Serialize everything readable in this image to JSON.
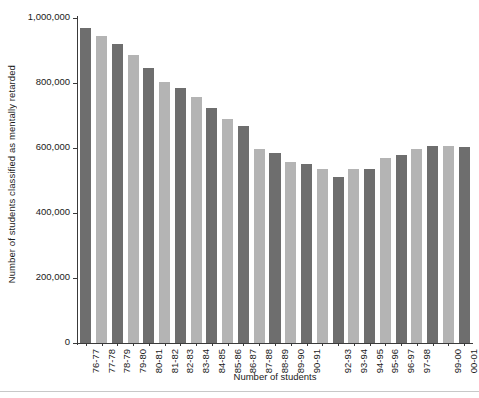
{
  "chart_data": {
    "type": "bar",
    "title": "",
    "xlabel": "Number of students",
    "ylabel": "Number of students classified as mentally retarded",
    "ylim": [
      0,
      1000000
    ],
    "grid": false,
    "legend": null,
    "ytick_labels": [
      "1,000,000",
      "800,000",
      "600,000",
      "400,000",
      "200,000",
      "0"
    ],
    "ytick_values": [
      1000000,
      800000,
      600000,
      400000,
      200000,
      0
    ],
    "categories": [
      "76-77",
      "77-78",
      "78-79",
      "79-80",
      "80-81",
      "81-82",
      "82-83",
      "83-84",
      "84-85",
      "85-86",
      "86-87",
      "87-88",
      "88-89",
      "89-90",
      "90-91",
      "91-92",
      "92-93",
      "93-94",
      "94-95",
      "95-96",
      "96-97",
      "97-98",
      "98-99",
      "99-00",
      "00-01"
    ],
    "xtick_labels_shown": [
      "76-77",
      "77-78",
      "78-79",
      "79-80",
      "80-81",
      "81-82",
      "82-83",
      "83-84",
      "84-85",
      "85-86",
      "86-87",
      "87-88",
      "88-89",
      "89-90",
      "90-91",
      "",
      "92-93",
      "93-94",
      "94-95",
      "95-96",
      "96-97",
      "97-98",
      "",
      "99-00",
      "00-01"
    ],
    "values": [
      969000,
      945000,
      920000,
      885000,
      846000,
      802000,
      786000,
      757000,
      722000,
      690000,
      667000,
      597000,
      585000,
      557000,
      551000,
      534000,
      512000,
      536000,
      534000,
      570000,
      580000,
      597000,
      605000,
      607000,
      604000
    ],
    "bar_colors": [
      "#6e6e6e",
      "#b4b4b4"
    ],
    "color_pattern": "alternating dark/light gray"
  },
  "axis": {
    "y_title": "Number of students classified as mentally retarded",
    "x_title": "Number of students"
  }
}
